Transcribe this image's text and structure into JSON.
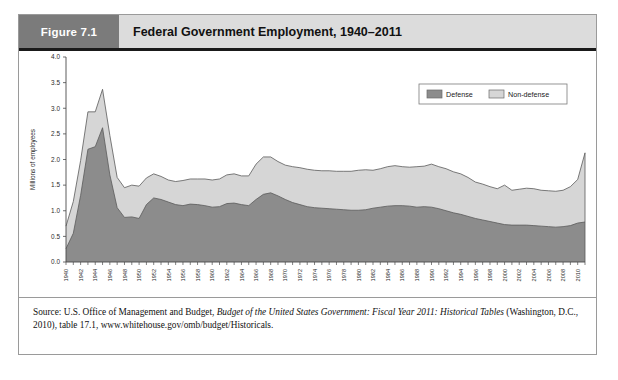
{
  "figure": {
    "number_label": "Figure 7.1",
    "title": "Federal Government Employment, 1940–2011"
  },
  "source": {
    "prefix": "Source: U.S. Office of Management and Budget, ",
    "italic_title": "Budget of the United States Government: Fiscal Year 2011: Historical Tables",
    "suffix": " (Washington, D.C., 2010), table 17.1, www.whitehouse.gov/omb/budget/Historicals."
  },
  "legend": {
    "defense_label": "Defense",
    "nondefense_label": "Non-defense",
    "defense_color": "#8c8c8c",
    "nondefense_color": "#d6d6d6",
    "position": "top-right"
  },
  "chart_data": {
    "type": "area",
    "stacked": true,
    "title": "Federal Government Employment, 1940–2011",
    "xlabel": "",
    "ylabel": "Millions of employees",
    "ylim": [
      0.0,
      4.0
    ],
    "xlim": [
      1940,
      2011
    ],
    "grid": false,
    "y_ticks": [
      "0.0",
      "0.5",
      "1.0",
      "1.5",
      "2.0",
      "2.5",
      "3.0",
      "3.5",
      "4.0"
    ],
    "y_tick_values": [
      0.0,
      0.5,
      1.0,
      1.5,
      2.0,
      2.5,
      3.0,
      3.5,
      4.0
    ],
    "x_tick_labels": [
      "1940",
      "1942",
      "1944",
      "1946",
      "1948",
      "1950",
      "1952",
      "1954",
      "1956",
      "1958",
      "1960",
      "1962",
      "1964",
      "1966",
      "1968",
      "1970",
      "1972",
      "1974",
      "1976",
      "1978",
      "1980",
      "1982",
      "1984",
      "1986",
      "1988",
      "1990",
      "1992",
      "1994",
      "1996",
      "1998",
      "2000",
      "2002",
      "2004",
      "2006",
      "2008",
      "2010"
    ],
    "x_tick_interval": 2,
    "minor_tick_interval": 1,
    "x": [
      1940,
      1941,
      1942,
      1943,
      1944,
      1945,
      1946,
      1947,
      1948,
      1949,
      1950,
      1951,
      1952,
      1953,
      1954,
      1955,
      1956,
      1957,
      1958,
      1959,
      1960,
      1961,
      1962,
      1963,
      1964,
      1965,
      1966,
      1967,
      1968,
      1969,
      1970,
      1971,
      1972,
      1973,
      1974,
      1975,
      1976,
      1977,
      1978,
      1979,
      1980,
      1981,
      1982,
      1983,
      1984,
      1985,
      1986,
      1987,
      1988,
      1989,
      1990,
      1991,
      1992,
      1993,
      1994,
      1995,
      1996,
      1997,
      1998,
      1999,
      2000,
      2001,
      2002,
      2003,
      2004,
      2005,
      2006,
      2007,
      2008,
      2009,
      2010,
      2011
    ],
    "series": [
      {
        "name": "Defense",
        "color": "#8c8c8c",
        "values": [
          0.26,
          0.56,
          1.3,
          2.2,
          2.25,
          2.62,
          1.7,
          1.06,
          0.87,
          0.88,
          0.85,
          1.12,
          1.25,
          1.22,
          1.17,
          1.12,
          1.1,
          1.13,
          1.12,
          1.1,
          1.07,
          1.08,
          1.14,
          1.15,
          1.12,
          1.1,
          1.22,
          1.32,
          1.35,
          1.29,
          1.22,
          1.16,
          1.12,
          1.08,
          1.06,
          1.05,
          1.04,
          1.03,
          1.02,
          1.01,
          1.01,
          1.02,
          1.05,
          1.07,
          1.09,
          1.1,
          1.1,
          1.09,
          1.07,
          1.08,
          1.07,
          1.04,
          1.0,
          0.96,
          0.93,
          0.89,
          0.85,
          0.82,
          0.79,
          0.76,
          0.73,
          0.72,
          0.72,
          0.72,
          0.71,
          0.7,
          0.69,
          0.68,
          0.69,
          0.71,
          0.76,
          0.78
        ]
      },
      {
        "name": "Non-defense",
        "color": "#d6d6d6",
        "values": [
          0.44,
          0.62,
          0.68,
          0.73,
          0.68,
          0.75,
          0.77,
          0.59,
          0.58,
          0.62,
          0.63,
          0.52,
          0.47,
          0.45,
          0.43,
          0.45,
          0.49,
          0.49,
          0.5,
          0.52,
          0.53,
          0.54,
          0.56,
          0.57,
          0.56,
          0.58,
          0.69,
          0.73,
          0.7,
          0.67,
          0.67,
          0.7,
          0.72,
          0.73,
          0.73,
          0.73,
          0.74,
          0.74,
          0.75,
          0.76,
          0.78,
          0.78,
          0.74,
          0.75,
          0.77,
          0.78,
          0.76,
          0.76,
          0.79,
          0.79,
          0.84,
          0.82,
          0.82,
          0.8,
          0.79,
          0.76,
          0.71,
          0.7,
          0.68,
          0.67,
          0.77,
          0.68,
          0.7,
          0.72,
          0.72,
          0.7,
          0.7,
          0.7,
          0.71,
          0.76,
          0.85,
          1.35
        ]
      }
    ],
    "totals": [
      0.7,
      1.18,
      1.98,
      2.93,
      2.93,
      3.37,
      2.47,
      1.65,
      1.45,
      1.5,
      1.48,
      1.64,
      1.72,
      1.67,
      1.6,
      1.57,
      1.59,
      1.62,
      1.62,
      1.62,
      1.6,
      1.62,
      1.7,
      1.72,
      1.68,
      1.68,
      1.91,
      2.05,
      2.05,
      1.96,
      1.89,
      1.86,
      1.84,
      1.81,
      1.79,
      1.78,
      1.78,
      1.77,
      1.77,
      1.77,
      1.79,
      1.8,
      1.79,
      1.82,
      1.86,
      1.88,
      1.86,
      1.85,
      1.86,
      1.87,
      1.91,
      1.86,
      1.82,
      1.76,
      1.72,
      1.65,
      1.56,
      1.52,
      1.47,
      1.43,
      1.5,
      1.4,
      1.42,
      1.44,
      1.43,
      1.4,
      1.39,
      1.38,
      1.4,
      1.47,
      1.61,
      2.13
    ],
    "annotations": []
  }
}
